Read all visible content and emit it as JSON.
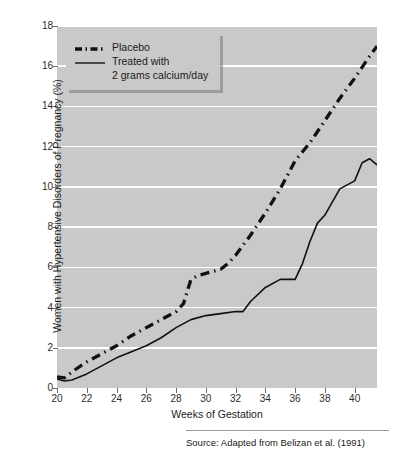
{
  "chart_data": {
    "type": "line",
    "title": "",
    "xlabel": "Weeks of Gestation",
    "ylabel": "Women with Hypertensive Disorders of Pregnancy (%)",
    "xlim": [
      20,
      41.5
    ],
    "ylim": [
      0,
      18
    ],
    "xticks": [
      20,
      22,
      24,
      26,
      28,
      30,
      32,
      34,
      36,
      38,
      40
    ],
    "yticks": [
      0,
      2,
      4,
      6,
      8,
      10,
      12,
      14,
      16,
      18
    ],
    "xtick_labels": [
      "20",
      "22",
      "24",
      "26",
      "28",
      "30",
      "32",
      "34",
      "36",
      "38",
      "40"
    ],
    "ytick_labels": [
      "0",
      "2",
      "4",
      "6",
      "8",
      "10",
      "12",
      "14",
      "16",
      "18"
    ],
    "grid": "horizontal",
    "legend_position": "top-left",
    "plot_background": "#c9c9c9",
    "gridline_color": "#ffffff",
    "line_color": "#111111",
    "series": [
      {
        "name": "Placebo",
        "style": "dash-dot",
        "x": [
          20,
          20.5,
          21,
          22,
          23,
          24,
          25,
          26,
          27,
          28,
          28.5,
          29,
          29.5,
          30,
          31,
          31.5,
          32,
          33,
          34,
          35,
          36,
          37,
          38,
          39,
          40,
          41,
          41.5
        ],
        "values": [
          0.55,
          0.5,
          0.8,
          1.3,
          1.7,
          2.1,
          2.6,
          3.0,
          3.4,
          3.8,
          4.2,
          5.4,
          5.6,
          5.7,
          5.9,
          6.2,
          6.6,
          7.6,
          8.7,
          9.9,
          11.3,
          12.2,
          13.3,
          14.4,
          15.4,
          16.5,
          17.0
        ]
      },
      {
        "name": "Treated with 2 grams calcium/day",
        "style": "solid",
        "x": [
          20,
          20.5,
          21,
          22,
          23,
          24,
          25,
          26,
          27,
          28,
          29,
          30,
          31,
          32,
          32.5,
          33,
          34,
          35,
          36,
          36.5,
          37,
          37.5,
          38,
          39,
          39.5,
          40,
          40.5,
          41,
          41.5
        ],
        "values": [
          0.45,
          0.35,
          0.4,
          0.7,
          1.1,
          1.5,
          1.8,
          2.1,
          2.5,
          3.0,
          3.4,
          3.6,
          3.7,
          3.8,
          3.8,
          4.3,
          5.0,
          5.4,
          5.4,
          6.2,
          7.3,
          8.2,
          8.6,
          9.9,
          10.1,
          10.3,
          11.2,
          11.4,
          11.1
        ]
      }
    ]
  },
  "legend": {
    "entries": [
      {
        "label": "Placebo",
        "style": "dash-dot"
      },
      {
        "label": "Treated with",
        "sublabel": "2 grams calcium/day",
        "style": "solid"
      }
    ]
  },
  "source": {
    "text": "Source: Adapted from Belizan et al. (1991)"
  }
}
